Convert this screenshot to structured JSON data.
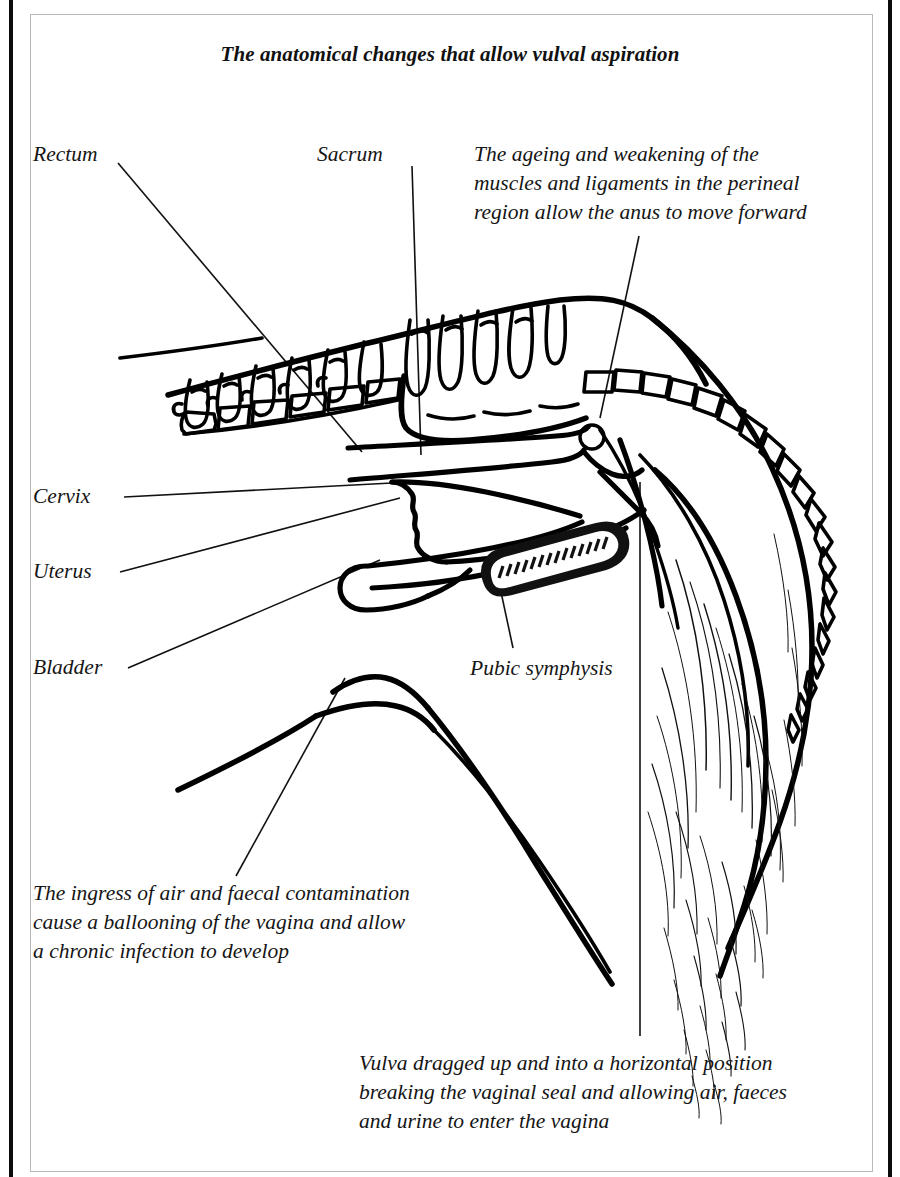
{
  "figure": {
    "title": "The anatomical changes that allow vulval aspiration"
  },
  "labels": {
    "rectum": "Rectum",
    "sacrum": "Sacrum",
    "cervix": "Cervix",
    "uterus": "Uterus",
    "bladder": "Bladder",
    "pubic_symphysis": "Pubic symphysis"
  },
  "annotations": {
    "top_right": "The ageing and weakening of the\nmuscles and ligaments in the perineal\nregion allow the anus to move forward",
    "bottom_left": "The ingress of air and faecal contamination\ncause a ballooning of the vagina and allow\na chronic infection to develop",
    "bottom_right": "Vulva dragged up and into a horizontal position\nbreaking the vaginal seal and allowing air, faeces\nand urine to enter the vagina"
  },
  "colors": {
    "ink": "#111111",
    "frame": "#b9b9b9",
    "edge_bar": "#0b0b0b",
    "background": "#ffffff"
  }
}
